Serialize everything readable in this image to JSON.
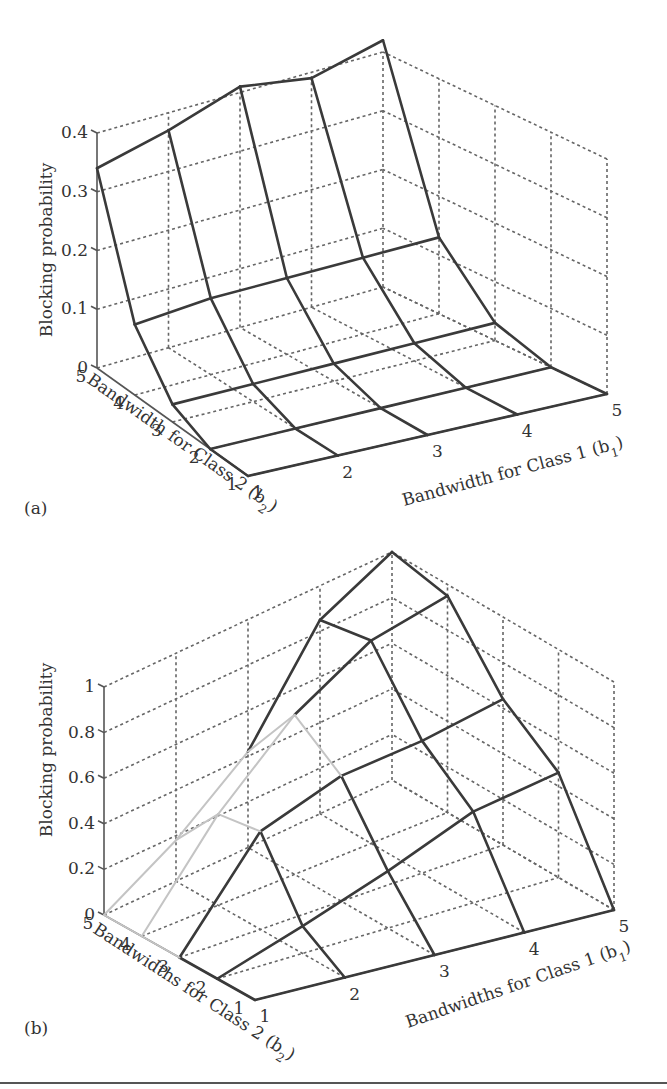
{
  "figure": {
    "panels": [
      {
        "id": "a",
        "label": "(a)"
      },
      {
        "id": "b",
        "label": "(b)"
      }
    ]
  },
  "chart_data": [
    {
      "type": "surface",
      "panel": "(a)",
      "title": "",
      "zlabel": "Blocking probability",
      "xlabel": "Bandwidth for Class 1 (b1)",
      "ylabel": "Bandwidth for Class 2 (b2)",
      "x_ticks": [
        "1",
        "2",
        "3",
        "4",
        "5"
      ],
      "y_ticks": [
        "1",
        "2",
        "3",
        "4",
        "5"
      ],
      "z_ticks": [
        "0",
        "0.1",
        "0.2",
        "0.3",
        "0.4"
      ],
      "zlim": [
        0,
        0.4
      ],
      "grid": true,
      "b1": [
        1,
        2,
        3,
        4,
        5
      ],
      "b2": [
        1,
        2,
        3,
        4,
        5
      ],
      "z": [
        [
          0.0,
          0.0,
          0.0,
          0.0,
          0.0
        ],
        [
          0.0,
          0.0,
          0.0,
          0.0,
          0.0
        ],
        [
          0.03,
          0.03,
          0.03,
          0.03,
          0.03
        ],
        [
          0.12,
          0.13,
          0.13,
          0.13,
          0.13
        ],
        [
          0.34,
          0.37,
          0.41,
          0.39,
          0.42
        ]
      ]
    },
    {
      "type": "surface",
      "panel": "(b)",
      "title": "",
      "zlabel": "Blocking probability",
      "xlabel": "Bandwidths for Class 1 (b1)",
      "ylabel": "Bandwidths for Class 2 (b2)",
      "x_ticks": [
        "1",
        "2",
        "3",
        "4",
        "5"
      ],
      "y_ticks": [
        "1",
        "2",
        "3",
        "4",
        "5"
      ],
      "z_ticks": [
        "0",
        "0.2",
        "0.4",
        "0.6",
        "0.8",
        "1"
      ],
      "zlim": [
        0,
        1
      ],
      "grid": true,
      "b1": [
        1,
        2,
        3,
        4,
        5
      ],
      "b2": [
        1,
        2,
        3,
        4,
        5
      ],
      "z": [
        [
          0.0,
          0.0,
          0.0,
          0.0,
          0.0
        ],
        [
          0.0,
          0.12,
          0.25,
          0.4,
          0.46
        ],
        [
          0.0,
          0.43,
          0.55,
          0.58,
          0.64
        ],
        [
          0.0,
          0.4,
          0.7,
          0.89,
          0.95
        ],
        [
          0.0,
          0.18,
          0.42,
          0.85,
          1.0
        ]
      ]
    }
  ],
  "labels": {
    "a": {
      "zlabel": "Blocking probability",
      "xlabel": "Bandwidth for Class 1 (b",
      "xsub": "1",
      "ylabel": "Bandwidth for Class 2 (b",
      "ysub": "2",
      "z_ticks": [
        "0",
        "0.1",
        "0.2",
        "0.3",
        "0.4"
      ],
      "b1_ticks": [
        "1",
        "2",
        "3",
        "4",
        "5"
      ],
      "b2_ticks": [
        "1",
        "2",
        "3",
        "4",
        "5"
      ]
    },
    "b": {
      "zlabel": "Blocking probability",
      "xlabel": "Bandwidths for Class 1 (b",
      "xsub": "1",
      "ylabel": "Bandwidths for Class 2 (b",
      "ysub": "2",
      "z_ticks": [
        "0",
        "0.2",
        "0.4",
        "0.6",
        "0.8",
        "1"
      ],
      "b1_ticks": [
        "1",
        "2",
        "3",
        "4",
        "5"
      ],
      "b2_ticks": [
        "1",
        "2",
        "3",
        "4",
        "5"
      ]
    }
  }
}
